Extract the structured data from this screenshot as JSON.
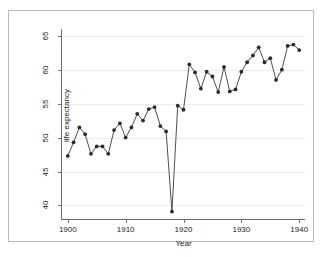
{
  "chart_data": {
    "type": "line",
    "title": "",
    "xlabel": "Year",
    "ylabel": "life expectancy",
    "xlim": [
      1899,
      1941
    ],
    "ylim": [
      38,
      66
    ],
    "xticks": [
      1900,
      1910,
      1920,
      1930,
      1940
    ],
    "yticks": [
      40,
      45,
      50,
      55,
      60,
      65
    ],
    "grid": "horizontal",
    "legend": "none",
    "marker": "filled-circle",
    "series": [
      {
        "name": "life expectancy",
        "x": [
          1900,
          1901,
          1902,
          1903,
          1904,
          1905,
          1906,
          1907,
          1908,
          1909,
          1910,
          1911,
          1912,
          1913,
          1914,
          1915,
          1916,
          1917,
          1918,
          1919,
          1920,
          1921,
          1922,
          1923,
          1924,
          1925,
          1926,
          1927,
          1928,
          1929,
          1930,
          1931,
          1932,
          1933,
          1934,
          1935,
          1936,
          1937,
          1938,
          1939,
          1940
        ],
        "values": [
          47.3,
          49.3,
          51.5,
          50.5,
          47.6,
          48.7,
          48.7,
          47.6,
          51.1,
          52.1,
          50.0,
          51.5,
          53.5,
          52.5,
          54.2,
          54.5,
          51.7,
          50.9,
          39.1,
          54.7,
          54.1,
          60.8,
          59.6,
          57.2,
          59.7,
          59.0,
          56.7,
          60.4,
          56.8,
          57.1,
          59.7,
          61.1,
          62.1,
          63.3,
          61.1,
          61.7,
          58.5,
          60.0,
          63.5,
          63.7,
          62.9
        ]
      }
    ]
  }
}
